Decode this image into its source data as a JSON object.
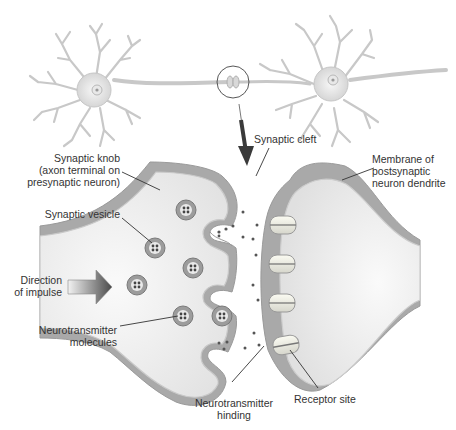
{
  "diagram": {
    "colors": {
      "neuron_fill": "#e6e6e6",
      "neuron_stroke": "#bdbdbd",
      "membrane_dark": "#a9a9a9",
      "membrane_light": "#d4d4d4",
      "cytoplasm": "#f0f0f0",
      "line": "#333333",
      "arrow": "#4a4a4a"
    },
    "labels": {
      "synaptic_cleft": "Synaptic cleft",
      "synaptic_knob": [
        "Synaptic knob",
        "(axon terminal on",
        "presynaptic neuron)"
      ],
      "membrane_postsynaptic": [
        "Membrane of",
        "postsynaptic",
        "neuron dendrite"
      ],
      "synaptic_vesicle": "Synaptic vesicle",
      "direction_of_impulse": [
        "Direction",
        "of impulse"
      ],
      "neurotransmitter_molecules": [
        "Neurotransmitter",
        "molecules"
      ],
      "neurotransmitter_binding": [
        "Neurotransmitter",
        "hinding"
      ],
      "receptor_site": "Receptor site"
    },
    "icons": {
      "neurons": "two-neurons-connected-by-axon",
      "magnify_circle": "zoom-circle-on-synapse",
      "down_arrow": "arrow-down-icon",
      "impulse_arrow": "arrow-right-gradient-icon"
    },
    "vesicle_count": 7,
    "receptor_count": 4
  }
}
